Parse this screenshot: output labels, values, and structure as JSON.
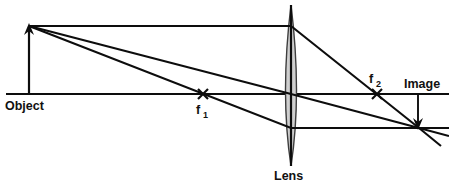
{
  "diagram": {
    "type": "optics-ray-diagram",
    "canvas": {
      "width": 449,
      "height": 187,
      "background": "#ffffff"
    },
    "colors": {
      "line": "#0d0d0d",
      "lens_fill": "#cfcfcf",
      "lens_stroke": "#3d3d3d",
      "text": "#111111",
      "background": "#ffffff"
    },
    "labels": {
      "object": "Object",
      "lens": "Lens",
      "image": "Image",
      "focal_near_base": "f",
      "focal_near_sub": "1",
      "focal_far_base": "f",
      "focal_far_sub": "2"
    },
    "geometry": {
      "optical_axis": {
        "x1": 6,
        "y1": 94,
        "x2": 449,
        "y2": 94
      },
      "object": {
        "base_x": 29,
        "base_y": 94,
        "tip_x": 29,
        "tip_y": 26,
        "height_px": 68,
        "arrow": "up"
      },
      "lens": {
        "center_x": 291,
        "center_y": 94,
        "top_y": 5,
        "bottom_y": 166,
        "half_width": 11
      },
      "focal_point_near": {
        "x": 203,
        "y": 94,
        "label_x": 200,
        "label_y": 110
      },
      "focal_point_far": {
        "x": 377,
        "y": 94,
        "label_x": 371,
        "label_y": 85
      },
      "image": {
        "base_x": 418,
        "base_y": 94,
        "tip_x": 418,
        "tip_y": 128,
        "height_px": 34,
        "arrow": "down",
        "label_x": 404,
        "label_y": 88
      },
      "convergence_point": {
        "x": 419,
        "y": 128
      }
    },
    "rays": [
      {
        "name": "parallel-ray",
        "description": "Ray from object tip travelling parallel to the axis, refracted through far focal point f2 to the image tip.",
        "points": [
          [
            29,
            26
          ],
          [
            291,
            26
          ],
          [
            419,
            128
          ],
          [
            441,
            146
          ]
        ]
      },
      {
        "name": "focal-ray",
        "description": "Ray from object tip through the near focal point f1, emerging parallel to the axis to the image tip.",
        "points": [
          [
            29,
            26
          ],
          [
            291,
            128
          ],
          [
            449,
            128
          ]
        ]
      },
      {
        "name": "center-ray",
        "description": "Ray from object tip through the centre of the lens, continuing undeviated to the image tip.",
        "points": [
          [
            29,
            26
          ],
          [
            291,
            94
          ],
          [
            419,
            128
          ],
          [
            449,
            136
          ]
        ]
      }
    ]
  }
}
